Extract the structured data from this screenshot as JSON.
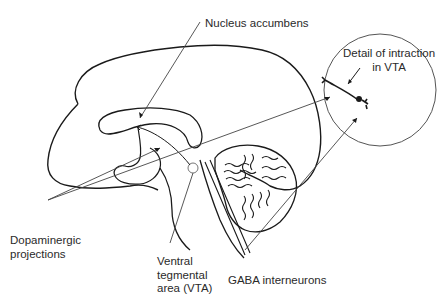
{
  "diagram": {
    "type": "anatomical-sagittal-brain",
    "stroke_color": "#1a1a1a",
    "leader_color": "#444444",
    "background": "#ffffff"
  },
  "labels": {
    "nucleus_accumbens": "Nucleus accumbens",
    "detail_vta": "Detail of intraction\nin VTA",
    "dopaminergic": "Dopaminergic\nprojections",
    "vta": "Ventral\ntegmental\narea (VTA)",
    "gaba": "GABA interneurons"
  },
  "icons": {
    "detail_circle": "magnified-detail-circle",
    "neuron": "neuron-synapse-icon",
    "vta_marker": "small-circle-marker"
  }
}
